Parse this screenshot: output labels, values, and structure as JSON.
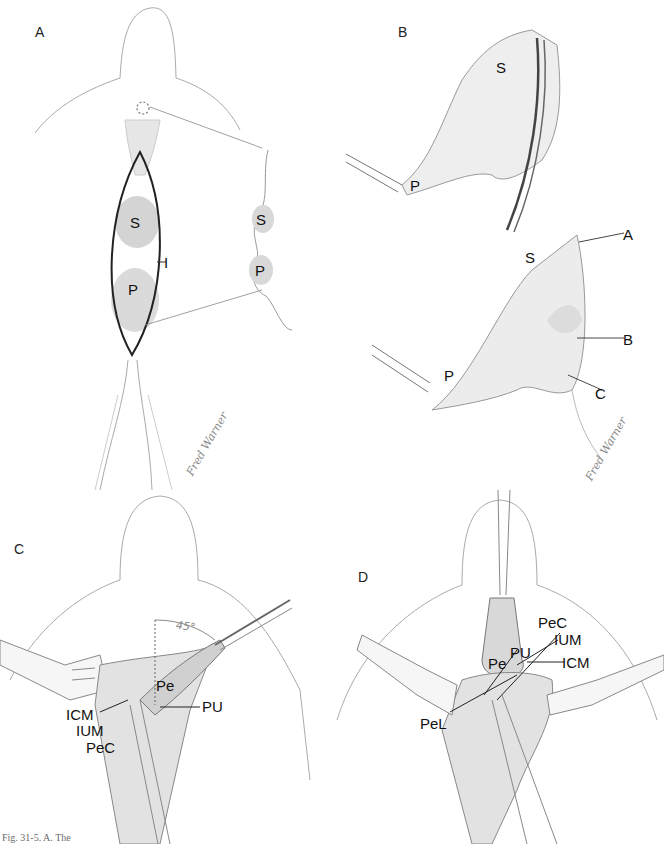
{
  "figure": {
    "caption_fragment": "Fig. 31-5. A. The",
    "signature": "Fred Warner",
    "panels": [
      {
        "id": "A",
        "label": "A",
        "labels": [
          "S",
          "P",
          "I",
          "S",
          "P"
        ]
      },
      {
        "id": "B",
        "label": "B",
        "labels": [
          "S",
          "P",
          "S",
          "A",
          "B",
          "P",
          "C"
        ]
      },
      {
        "id": "C",
        "label": "C",
        "angle": "45°",
        "labels": [
          "Pe",
          "PU",
          "ICM",
          "IUM",
          "PeC"
        ]
      },
      {
        "id": "D",
        "label": "D",
        "labels": [
          "PeC",
          "IUM",
          "PU",
          "Pe",
          "ICM",
          "PeL"
        ]
      }
    ]
  },
  "panelA": {
    "label": "A",
    "front_S": "S",
    "front_P": "P",
    "incision": "I",
    "side_S": "S",
    "side_P": "P"
  },
  "panelB": {
    "label": "B",
    "top_S": "S",
    "top_P": "P",
    "bottom_S": "S",
    "bottom_P": "P",
    "marker_A": "A",
    "marker_B": "B",
    "marker_C": "C",
    "signature": "Fred Warner"
  },
  "panelC": {
    "label": "C",
    "angle": "45°",
    "Pe": "Pe",
    "PU": "PU",
    "ICM": "ICM",
    "IUM": "IUM",
    "PeC": "PeC"
  },
  "panelD": {
    "label": "D",
    "PeC": "PeC",
    "IUM": "IUM",
    "ICM": "ICM",
    "PU": "PU",
    "Pe": "Pe",
    "PeL": "PeL"
  },
  "signatureA": "Fred Warner"
}
